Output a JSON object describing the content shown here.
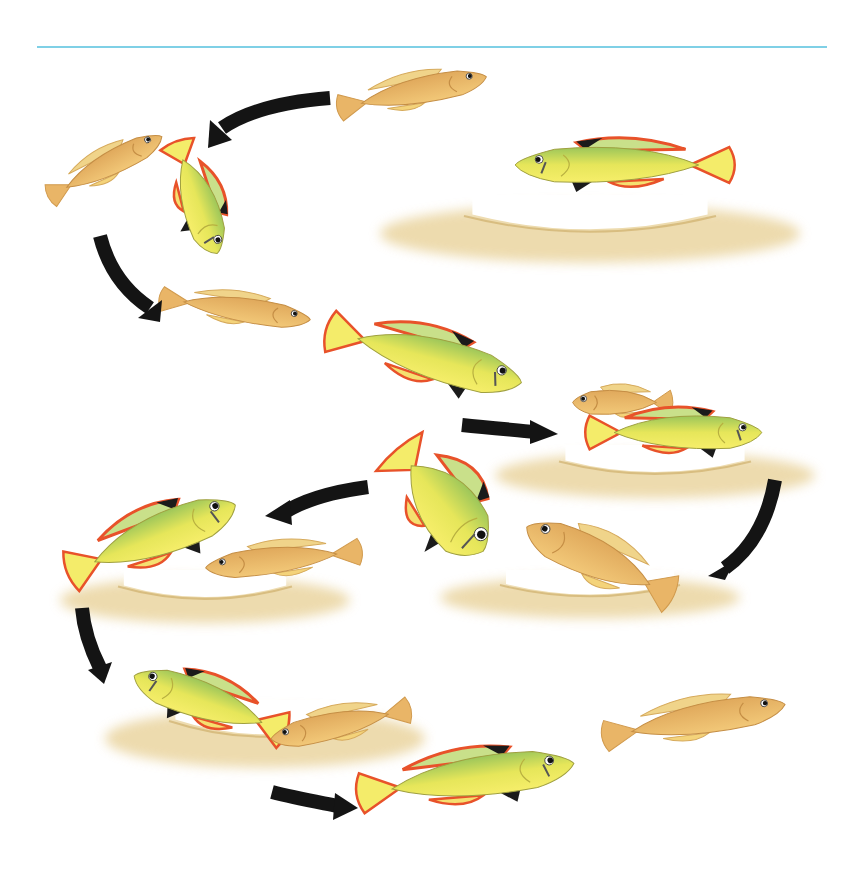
{
  "figure": {
    "rule_color": "#7fd0e6",
    "colors": {
      "female_body": "#e9b567",
      "female_belly": "#f4cf7e",
      "male_body": "#f3e85a",
      "male_back": "#9cc65a",
      "male_fin_red": "#e8522a",
      "male_fin_black": "#1b1b1b",
      "sand": "#e7cf93",
      "arrow": "#141414"
    },
    "sand": [
      {
        "x": 380,
        "y": 195,
        "w": 420,
        "h": 70
      },
      {
        "x": 495,
        "y": 445,
        "w": 320,
        "h": 55
      },
      {
        "x": 60,
        "y": 570,
        "w": 290,
        "h": 55
      },
      {
        "x": 440,
        "y": 570,
        "w": 300,
        "h": 50
      },
      {
        "x": 105,
        "y": 700,
        "w": 320,
        "h": 70
      }
    ],
    "fish": [
      {
        "sex": "female",
        "x": 335,
        "y": 62,
        "w": 160,
        "h": 60,
        "dir": "right",
        "rot": -12
      },
      {
        "sex": "female",
        "x": 40,
        "y": 138,
        "w": 135,
        "h": 55,
        "dir": "right",
        "rot": -28
      },
      {
        "sex": "male",
        "x": 135,
        "y": 160,
        "w": 125,
        "h": 80,
        "dir": "down",
        "rot": 0
      },
      {
        "sex": "male",
        "x": 505,
        "y": 125,
        "w": 230,
        "h": 80,
        "dir": "left",
        "rot": 0
      },
      {
        "sex": "female",
        "x": 158,
        "y": 282,
        "w": 160,
        "h": 55,
        "dir": "right",
        "rot": 8
      },
      {
        "sex": "male",
        "x": 322,
        "y": 310,
        "w": 212,
        "h": 95,
        "dir": "right",
        "rot": 15
      },
      {
        "sex": "female",
        "x": 568,
        "y": 375,
        "w": 105,
        "h": 55,
        "dir": "left",
        "rot": 0
      },
      {
        "sex": "male",
        "x": 585,
        "y": 395,
        "w": 185,
        "h": 75,
        "dir": "right",
        "rot": 0
      },
      {
        "sex": "male",
        "x": 372,
        "y": 435,
        "w": 140,
        "h": 135,
        "dir": "right",
        "rot": 50
      },
      {
        "sex": "male",
        "x": 60,
        "y": 490,
        "w": 190,
        "h": 95,
        "dir": "right",
        "rot": -22
      },
      {
        "sex": "female",
        "x": 198,
        "y": 530,
        "w": 165,
        "h": 60,
        "dir": "left",
        "rot": -6
      },
      {
        "sex": "female",
        "x": 512,
        "y": 515,
        "w": 170,
        "h": 90,
        "dir": "left",
        "rot": 25
      },
      {
        "sex": "male",
        "x": 122,
        "y": 660,
        "w": 170,
        "h": 85,
        "dir": "left",
        "rot": 20
      },
      {
        "sex": "female",
        "x": 263,
        "y": 695,
        "w": 150,
        "h": 60,
        "dir": "left",
        "rot": -12
      },
      {
        "sex": "female",
        "x": 600,
        "y": 685,
        "w": 195,
        "h": 70,
        "dir": "right",
        "rot": -10
      },
      {
        "sex": "male",
        "x": 355,
        "y": 733,
        "w": 230,
        "h": 90,
        "dir": "right",
        "rot": -8
      }
    ],
    "arrows": [
      {
        "d": "M330 98 C280 102 245 112 222 128",
        "head": [
          210,
          120,
          232,
          140,
          208,
          148
        ]
      },
      {
        "d": "M100 236 C108 268 126 292 150 308",
        "head": [
          138,
          318,
          162,
          300,
          160,
          322
        ]
      },
      {
        "d": "M462 425 C490 428 515 430 535 432",
        "head": [
          530,
          420,
          558,
          434,
          530,
          444
        ]
      },
      {
        "d": "M775 480 C768 520 750 550 725 568",
        "head": [
          708,
          576,
          735,
          560,
          725,
          580
        ]
      },
      {
        "d": "M368 487 C330 492 300 502 282 514",
        "head": [
          265,
          516,
          290,
          500,
          292,
          525
        ]
      },
      {
        "d": "M82 608 C84 632 92 652 100 668",
        "head": [
          88,
          670,
          112,
          662,
          104,
          684
        ]
      },
      {
        "d": "M272 792 C295 798 318 802 338 806",
        "head": [
          335,
          793,
          358,
          808,
          333,
          820
        ]
      }
    ]
  }
}
